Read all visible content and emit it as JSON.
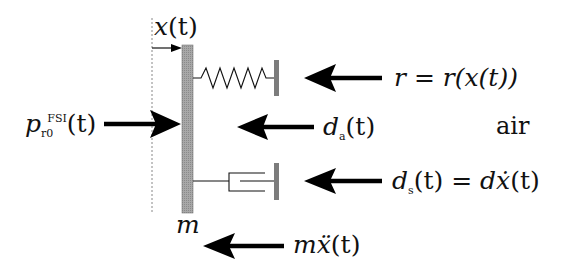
{
  "diagram": {
    "colors": {
      "mass_fill": "#9a9a9a",
      "wall_fill": "#7c7c7c",
      "arrow": "#000000",
      "line": "#111111",
      "reference_line": "#888888",
      "background": "#ffffff"
    },
    "labels": {
      "displacement": {
        "base": "x",
        "arg": "(t)"
      },
      "pressure": {
        "base": "p",
        "subscript": "r0",
        "superscript": "FSI",
        "arg": "(t)"
      },
      "spring_force": {
        "lhs": "r",
        "eq": " = ",
        "rhs": "r(x(t))"
      },
      "air_damping": {
        "base": "d",
        "subscript": "a",
        "arg": "(t)"
      },
      "medium": "air",
      "structural_damping": {
        "base": "d",
        "subscript": "s",
        "arg": "(t)",
        "eq": " = ",
        "rhs_coef": "d",
        "rhs_var": "ẋ",
        "rhs_arg": "(t)"
      },
      "mass": "m",
      "inertia": {
        "coef": "m",
        "var": "ẍ",
        "arg": "(t)"
      }
    },
    "components": [
      "reference-line",
      "mass-plate",
      "spring",
      "spring-wall",
      "damper",
      "damper-wall"
    ],
    "forces": [
      {
        "name": "pressure-force",
        "direction": "right"
      },
      {
        "name": "spring-force",
        "direction": "left"
      },
      {
        "name": "air-damping-force",
        "direction": "left"
      },
      {
        "name": "structural-damping-force",
        "direction": "left"
      },
      {
        "name": "inertia-force",
        "direction": "left"
      },
      {
        "name": "displacement-arrow",
        "direction": "right"
      }
    ]
  }
}
